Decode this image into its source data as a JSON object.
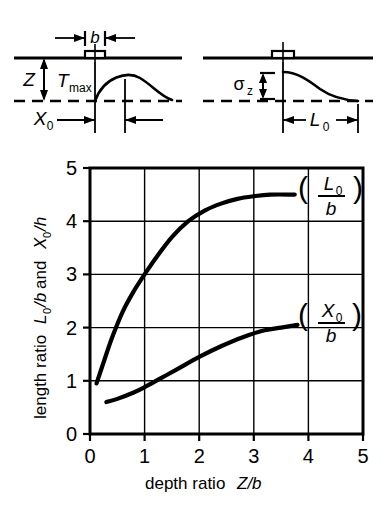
{
  "figure": {
    "caption_top_left": "left-section-sketch",
    "caption_top_right": "right-section-sketch"
  },
  "sketch_left": {
    "width_label": "b",
    "depth_label": "Z",
    "stress_label": "T",
    "stress_label_sub": "max",
    "offset_label": "X",
    "offset_label_sub": "0"
  },
  "sketch_right": {
    "stress_label": "σ",
    "stress_label_sub": "z",
    "length_label": "L",
    "length_label_sub": "0"
  },
  "chart_data": {
    "type": "line",
    "title": "",
    "xlabel": "depth ratio Z/b",
    "ylabel": "length ratio L₀/b and X₀/h",
    "xlabel_parts": {
      "text": "depth ratio ",
      "italic": "Z/b"
    },
    "ylabel_parts": {
      "text1": "length ratio ",
      "italic1": "L",
      "sub1": "0",
      "text2": "/b",
      "text3": " and ",
      "italic2": "X",
      "sub2": "0",
      "text4": "/h"
    },
    "xlim": [
      0,
      5
    ],
    "ylim": [
      0,
      5
    ],
    "xticks": [
      0,
      1,
      2,
      3,
      4,
      5
    ],
    "yticks": [
      0,
      1,
      2,
      3,
      4,
      5
    ],
    "xtick_labels": [
      "0",
      "1",
      "2",
      "3",
      "4",
      "5"
    ],
    "ytick_labels": [
      "0",
      "1",
      "2",
      "3",
      "4",
      "5"
    ],
    "grid": true,
    "legend_position": "inline-right",
    "series": [
      {
        "name": "(L₀/b)",
        "label_num": "L",
        "label_num_sub": "0",
        "label_den": "b",
        "x": [
          0.12,
          0.25,
          0.4,
          0.6,
          0.8,
          1.0,
          1.2,
          1.5,
          1.8,
          2.1,
          2.4,
          2.7,
          3.0,
          3.3,
          3.75
        ],
        "y": [
          0.95,
          1.35,
          1.8,
          2.3,
          2.68,
          3.0,
          3.3,
          3.7,
          4.0,
          4.2,
          4.33,
          4.42,
          4.47,
          4.5,
          4.5
        ]
      },
      {
        "name": "(X₀/b)",
        "label_num": "X",
        "label_num_sub": "0",
        "label_den": "b",
        "x": [
          0.3,
          0.5,
          0.8,
          1.0,
          1.3,
          1.6,
          2.0,
          2.4,
          2.8,
          3.2,
          3.5,
          3.8
        ],
        "y": [
          0.6,
          0.66,
          0.78,
          0.88,
          1.05,
          1.22,
          1.45,
          1.65,
          1.82,
          1.95,
          2.0,
          2.05
        ]
      }
    ]
  }
}
